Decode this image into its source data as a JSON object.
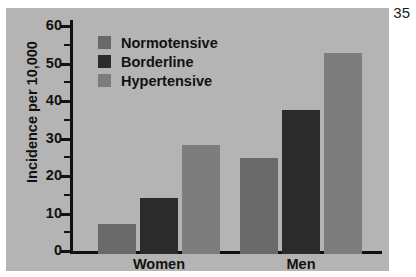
{
  "page_number": "35",
  "chart_data": {
    "type": "bar",
    "title": "",
    "subtitle": "",
    "xlabel": "",
    "ylabel": "Incidence per 10,000",
    "categories": [
      "Women",
      "Men"
    ],
    "series": [
      {
        "name": "Normotensive",
        "values": [
          8,
          25.5
        ],
        "color": "#696969"
      },
      {
        "name": "Borderline",
        "values": [
          15,
          38.5
        ],
        "color": "#2b2b2b"
      },
      {
        "name": "Hypertensive",
        "values": [
          29,
          53.5
        ],
        "color": "#7d7d7d"
      }
    ],
    "ylim": [
      0,
      60
    ],
    "yticks": [
      0,
      10,
      20,
      30,
      40,
      50,
      60
    ],
    "ytick_labels": [
      "0",
      "10",
      "20",
      "30",
      "40",
      "50",
      "60"
    ],
    "yminor_ticks": [
      5,
      15,
      25,
      35,
      45,
      55
    ],
    "grid": false,
    "legend_position": "upper-left-inside",
    "plot_background": "#b4b4b4",
    "axis_color": "#111111"
  }
}
